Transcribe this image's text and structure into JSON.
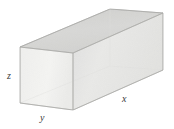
{
  "figure": {
    "kind": "rectangular-box-3d",
    "background_color": "#ffffff"
  },
  "labels": {
    "height": "z",
    "depth": "y",
    "length": "x"
  },
  "faces": {
    "top": {
      "name": "top-face",
      "fill": "#d5d5d3",
      "stroke": "#b4b4b2"
    },
    "front_right": {
      "name": "front-right-face",
      "fill": "#e6e6e4",
      "stroke": "#c2c2c0"
    },
    "front_left": {
      "name": "front-left-face",
      "fill": "#f1f1ef",
      "stroke": "#c2c2c0"
    }
  },
  "geometry": {
    "vertices": {
      "front_bottom": "73,110",
      "front_top": "73,53",
      "left_bottom": "20,103",
      "left_top": "20,47",
      "back_top": "110,9",
      "right_top": "163,13",
      "right_bottom": "163,70",
      "back_bottom_hidden": "110,66"
    },
    "projection": "oblique"
  }
}
